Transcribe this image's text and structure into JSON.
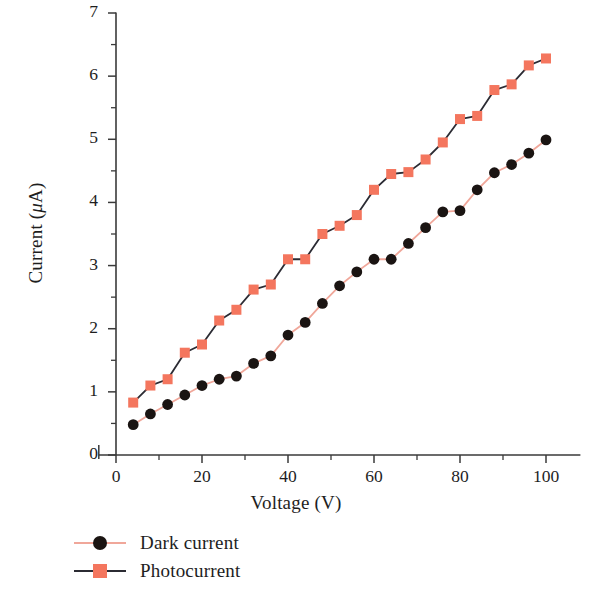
{
  "chart_data": {
    "type": "line",
    "title": "",
    "xlabel": "Voltage (V)",
    "ylabel": "Current (μA)",
    "xlim": [
      -4,
      108
    ],
    "ylim": [
      0,
      7
    ],
    "xticks": [
      0,
      20,
      40,
      60,
      80,
      100
    ],
    "yticks": [
      0,
      1,
      2,
      3,
      4,
      5,
      6,
      7
    ],
    "xtick_labels": [
      "0",
      "20",
      "40",
      "60",
      "80",
      "100"
    ],
    "ytick_labels": [
      "0",
      "1",
      "2",
      "3",
      "4",
      "5",
      "6",
      "7"
    ],
    "x_minor_tick_step": 10,
    "y_minor_tick_step": 0.5,
    "grid": false,
    "legend_position": "below-left",
    "series": [
      {
        "name": "Dark current",
        "marker": "circle",
        "marker_color": "#1a1412",
        "line_color": "#f0a79a",
        "x": [
          4,
          8,
          12,
          16,
          20,
          24,
          28,
          32,
          36,
          40,
          44,
          48,
          52,
          56,
          60,
          64,
          68,
          72,
          76,
          80,
          84,
          88,
          92,
          96,
          100
        ],
        "y": [
          0.48,
          0.65,
          0.8,
          0.95,
          1.1,
          1.2,
          1.25,
          1.45,
          1.57,
          1.9,
          2.1,
          2.4,
          2.68,
          2.9,
          3.1,
          3.1,
          3.35,
          3.6,
          3.85,
          3.87,
          4.2,
          4.47,
          4.6,
          4.78,
          4.99
        ]
      },
      {
        "name": "Photocurrent",
        "marker": "square",
        "marker_color": "#f4765e",
        "line_color": "#2b2b33",
        "x": [
          4,
          8,
          12,
          16,
          20,
          24,
          28,
          32,
          36,
          40,
          44,
          48,
          52,
          56,
          60,
          64,
          68,
          72,
          76,
          80,
          84,
          88,
          92,
          96,
          100
        ],
        "y": [
          0.83,
          1.1,
          1.2,
          1.62,
          1.75,
          2.13,
          2.3,
          2.62,
          2.7,
          3.1,
          3.1,
          3.5,
          3.63,
          3.8,
          4.2,
          4.45,
          4.48,
          4.68,
          4.95,
          5.32,
          5.37,
          5.78,
          5.87,
          6.17,
          6.28
        ]
      }
    ]
  },
  "legend": {
    "items": [
      {
        "label": "Dark current",
        "marker": "circle",
        "marker_color": "#1a1412",
        "line_color": "#f0a79a"
      },
      {
        "label": "Photocurrent",
        "marker": "square",
        "marker_color": "#f4765e",
        "line_color": "#2b2b33"
      }
    ]
  },
  "axis": {
    "x_title": "Voltage (V)",
    "y_title_prefix": "Current (",
    "y_title_mu": "μ",
    "y_title_suffix": "A)"
  },
  "colors": {
    "salmon": "#f4765e",
    "salmon_line": "#f0a79a",
    "dark": "#1a1412",
    "axis": "#3a3a3a"
  }
}
